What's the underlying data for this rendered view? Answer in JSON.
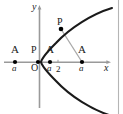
{
  "figure": {
    "axes": {
      "x_label": "x",
      "y_label": "y",
      "origin_label": "O"
    },
    "colors": {
      "curve": "#1a1a1a",
      "axis": "#9a9a9a",
      "chord": "#a8a8a8",
      "point": "#000000",
      "text": "#1a1a1a",
      "border": "#b5b5b5",
      "background": "#ffffff"
    },
    "labels": [
      {
        "name": "left-A",
        "letter": "A",
        "sub": "a",
        "x": 12,
        "y": 47
      },
      {
        "name": "left-P",
        "letter": "P",
        "x": 33,
        "y": 48
      },
      {
        "name": "vertex-A",
        "letter": "A",
        "sub": "a",
        "x": 45,
        "y": 47
      },
      {
        "name": "tick-two",
        "letter": "2",
        "x": 57,
        "y": 59
      },
      {
        "name": "right-A",
        "letter": "A",
        "sub": "a",
        "x": 78,
        "y": 47
      },
      {
        "name": "curve-P",
        "letter": "P",
        "x": 58,
        "y": 18
      },
      {
        "name": "origin",
        "letter": "O",
        "x": 33,
        "y": 60
      },
      {
        "name": "x-axis-label",
        "letter": "x",
        "x": 106,
        "y": 60
      },
      {
        "name": "y-axis-label",
        "letter": "y",
        "x": 33,
        "y": 2
      }
    ],
    "points": [
      {
        "name": "point-left-A",
        "cx": 15,
        "cy": 62
      },
      {
        "name": "point-left-P",
        "cx": 38,
        "cy": 62
      },
      {
        "name": "point-vertex-A",
        "cx": 50,
        "cy": 62
      },
      {
        "name": "point-right-A",
        "cx": 82,
        "cy": 62
      },
      {
        "name": "point-curve-P",
        "cx": 61,
        "cy": 29
      }
    ],
    "curve": {
      "name": "parabola",
      "description": "rightward opening parabola, vertex near origin"
    },
    "chord": {
      "name": "focal-chord",
      "from": "point-curve-P",
      "to": "point-right-A"
    }
  }
}
